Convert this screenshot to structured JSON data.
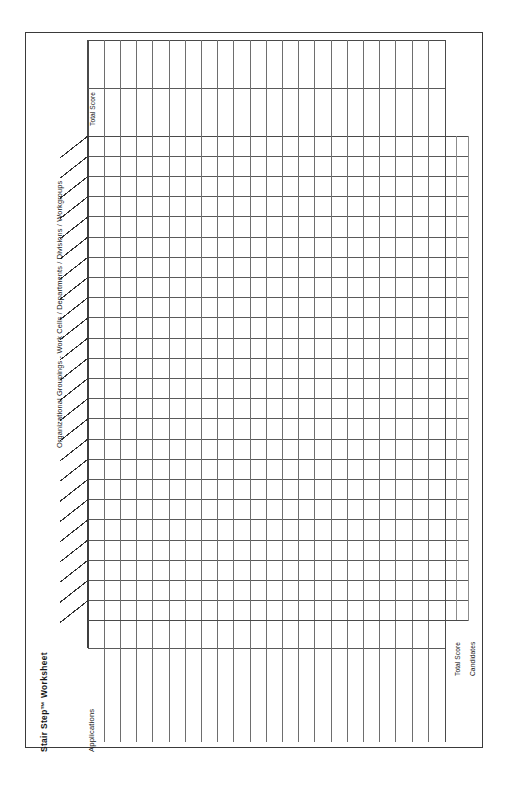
{
  "document": {
    "title": "Stair Step™ Worksheet",
    "form_type": "blank-grid-worksheet",
    "orientation": "portrait"
  },
  "labels": {
    "title": "Stair Step™ Worksheet",
    "applications": "Applications",
    "groupings": "Organizational Groupings - Work Cells / Departments / Divisions / Workgroups",
    "total_score_top": "Total Score",
    "total_score_bottom": "Total Score",
    "candidates": "Candidates"
  },
  "colors": {
    "page_background": "#ffffff",
    "frame_border": "#3a3a3a",
    "grid_line_dark": "#4a4a4a",
    "grid_line_light": "#8c8c8c",
    "text": "#161616"
  },
  "grid": {
    "main": {
      "rows": 24,
      "columns": 22,
      "extra_right_columns": 2,
      "left": 88,
      "top": 136,
      "right": 445,
      "bottom": 620,
      "row_height": 20.2,
      "column_width": 16.2,
      "extra_column_width": 11.5,
      "extra_columns_right_edge": 468
    },
    "top_header": {
      "columns": 22,
      "left": 88,
      "top": 40,
      "right": 445,
      "bottom": 136,
      "divider_y": 88,
      "description": "vertical header strip above the stair-step body, split by one horizontal rule"
    },
    "bottom_applications": {
      "columns": 22,
      "left": 88,
      "top": 620,
      "right": 445,
      "bottom": 742,
      "divider_y": 648,
      "description": "tall ruled column strip for the Applications axis"
    },
    "staircase": {
      "steps": 24,
      "diagonal_dx": -28,
      "diagonal_dy": 22,
      "description": "diagonal tick extending down-left from the left edge of each body row"
    }
  },
  "cells": {
    "main_values": [],
    "top_header_values": [],
    "applications_values": []
  }
}
